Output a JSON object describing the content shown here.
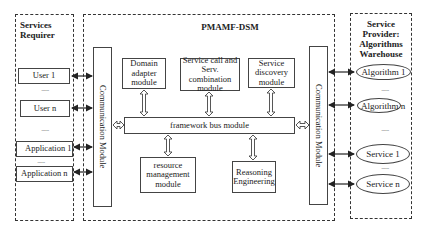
{
  "services_requirer": {
    "title": "Services Requirer",
    "items": [
      {
        "label": "User 1"
      },
      {
        "label": "User n"
      },
      {
        "label": "Application 1"
      },
      {
        "label": "Application n"
      }
    ],
    "ellipsis": "......"
  },
  "main_framework": {
    "title": "PMAMF-DSM",
    "left_comm": "Communication Module",
    "right_comm": "Communication Module",
    "top_modules": [
      {
        "label": "Domain adapter module"
      },
      {
        "label": "Service call and Serv. combination module"
      },
      {
        "label": "Service discovery module"
      }
    ],
    "bus": "framework bus module",
    "bottom_modules": [
      {
        "label": "resource management module"
      },
      {
        "label": "Reasoning Engineering"
      }
    ]
  },
  "service_provider": {
    "title": "Service Provider: Algorithms Warehouse",
    "items": [
      {
        "label": "Algorithm 1"
      },
      {
        "label": "Algorithm n"
      },
      {
        "label": "Service 1"
      },
      {
        "label": "Service n"
      }
    ],
    "ellipsis": "......"
  }
}
